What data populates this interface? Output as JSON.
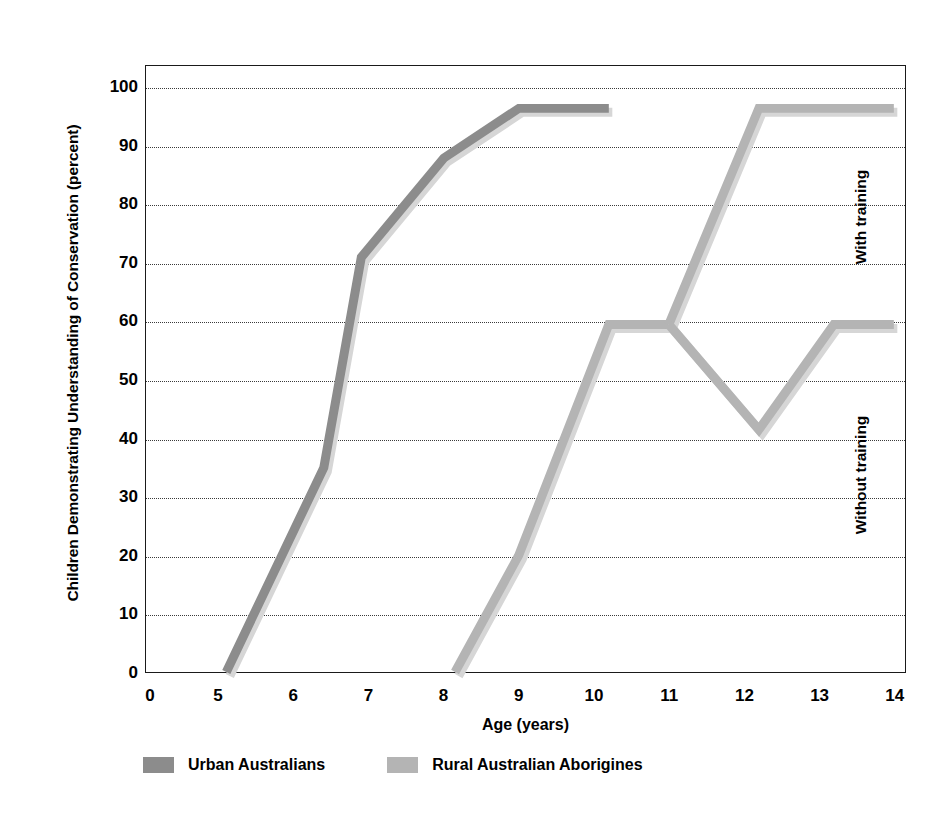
{
  "chart_data": {
    "type": "line",
    "title": "",
    "xlabel": "Age (years)",
    "ylabel": "Children Demonstrating Understanding of Conservation (percent)",
    "xlim": [
      0,
      14
    ],
    "ylim": [
      0,
      100
    ],
    "grid": true,
    "legend_position": "bottom",
    "x_tick_labels": [
      "0",
      "5",
      "6",
      "7",
      "8",
      "9",
      "10",
      "11",
      "12",
      "13",
      "14"
    ],
    "y_tick_labels": [
      "0",
      "10",
      "20",
      "30",
      "40",
      "50",
      "60",
      "70",
      "80",
      "90",
      "100"
    ],
    "annotations": [
      {
        "text": "With training",
        "x": 13.55,
        "y": 78
      },
      {
        "text": "Without training",
        "x": 13.55,
        "y": 34
      }
    ],
    "series": [
      {
        "name": "Urban Australians",
        "color": "#8c8c8c",
        "points": [
          {
            "x": 5.1,
            "y": 0
          },
          {
            "x": 6.4,
            "y": 35
          },
          {
            "x": 6.9,
            "y": 71
          },
          {
            "x": 8.0,
            "y": 88
          },
          {
            "x": 9.0,
            "y": 96.5
          },
          {
            "x": 10.2,
            "y": 96.5
          }
        ]
      },
      {
        "name": "Rural Australian Aborigines",
        "color": "#b4b4b4",
        "points": [
          {
            "x": 8.15,
            "y": 0
          },
          {
            "x": 9.0,
            "y": 20
          },
          {
            "x": 10.2,
            "y": 59.5
          },
          {
            "x": 11.0,
            "y": 59.5
          }
        ],
        "branches": [
          {
            "label": "With training",
            "points": [
              {
                "x": 11.0,
                "y": 59.5
              },
              {
                "x": 12.2,
                "y": 96.5
              },
              {
                "x": 14.0,
                "y": 96.5
              }
            ]
          },
          {
            "label": "Without training",
            "points": [
              {
                "x": 11.0,
                "y": 59.5
              },
              {
                "x": 12.2,
                "y": 41.5
              },
              {
                "x": 13.2,
                "y": 59.5
              },
              {
                "x": 14.0,
                "y": 59.5
              }
            ]
          }
        ]
      }
    ],
    "legend": [
      {
        "label": "Urban Australians",
        "color": "#8c8c8c"
      },
      {
        "label": "Rural Australian Aborigines",
        "color": "#b4b4b4"
      }
    ]
  },
  "axis": {
    "x_title": "Age (years)",
    "y_title": "Children Demonstrating Understanding of Conservation (percent)"
  },
  "colors": {
    "urban": "#8c8c8c",
    "rural": "#b4b4b4",
    "axis": "#1a1a1a",
    "grid": "#3a3a3a",
    "background": "#ffffff"
  }
}
